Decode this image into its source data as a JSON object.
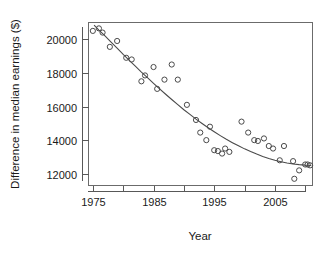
{
  "chart_data": {
    "type": "scatter",
    "title": "",
    "xlabel": "Year",
    "ylabel": "Difference in median earnings ($)",
    "xlim": [
      1974.2,
      2011.2
    ],
    "ylim": [
      11300,
      21000
    ],
    "grid": false,
    "legend": null,
    "xticks": [
      1975,
      1980,
      1985,
      1990,
      1995,
      2000,
      2005,
      2010
    ],
    "xtick_labels": [
      "1975",
      "",
      "1985",
      "",
      "1995",
      "",
      "2005",
      ""
    ],
    "yticks": [
      12000,
      14000,
      16000,
      18000,
      20000
    ],
    "ytick_labels": [
      "12000",
      "14000",
      "16000",
      "18000",
      "20000"
    ],
    "point_marker": "open-circle",
    "point_color": "#4a4a4a",
    "curve_color": "#4a4a4a",
    "x": [
      1975,
      1976,
      1976,
      1977,
      1978,
      1979,
      1980,
      1981,
      1982,
      1983,
      1984,
      1985,
      1986,
      1987,
      1988,
      1989,
      1990,
      1991,
      1992,
      1993,
      1994,
      1995,
      1996,
      1996,
      1997,
      1998,
      1999,
      2000,
      2001,
      2002,
      2003,
      2004,
      2005,
      2006,
      2007,
      2008,
      2009,
      2010,
      2011
    ],
    "y": [
      20500,
      20650,
      20400,
      19550,
      19900,
      18900,
      18800,
      17500,
      17850,
      18350,
      17050,
      17600,
      18500,
      17600,
      16100,
      15200,
      14450,
      14000,
      14800,
      13400,
      13350,
      13200,
      13500,
      13300,
      15100,
      14450,
      14000,
      13950,
      14100,
      13650,
      13500,
      12800,
      13650,
      12750,
      11700,
      12200,
      12550,
      12550,
      12500
    ],
    "series": [
      {
        "name": "Observed difference in median earnings",
        "points": [
          {
            "x": 1975,
            "y": 20500
          },
          {
            "x": 1976,
            "y": 20650
          },
          {
            "x": 1976.6,
            "y": 20400
          },
          {
            "x": 1977.8,
            "y": 19550
          },
          {
            "x": 1979,
            "y": 19900
          },
          {
            "x": 1980.5,
            "y": 18900
          },
          {
            "x": 1981.4,
            "y": 18800
          },
          {
            "x": 1983,
            "y": 17500
          },
          {
            "x": 1983.6,
            "y": 17850
          },
          {
            "x": 1985,
            "y": 18350
          },
          {
            "x": 1985.6,
            "y": 17050
          },
          {
            "x": 1986.8,
            "y": 17600
          },
          {
            "x": 1988,
            "y": 18500
          },
          {
            "x": 1989,
            "y": 17600
          },
          {
            "x": 1990.5,
            "y": 16100
          },
          {
            "x": 1992,
            "y": 15200
          },
          {
            "x": 1992.7,
            "y": 14450
          },
          {
            "x": 1993.7,
            "y": 14000
          },
          {
            "x": 1994.3,
            "y": 14800
          },
          {
            "x": 1995,
            "y": 13400
          },
          {
            "x": 1995.6,
            "y": 13350
          },
          {
            "x": 1996.3,
            "y": 13200
          },
          {
            "x": 1996.8,
            "y": 13500
          },
          {
            "x": 1997.5,
            "y": 13300
          },
          {
            "x": 1999.5,
            "y": 15100
          },
          {
            "x": 2000.6,
            "y": 14450
          },
          {
            "x": 2001.6,
            "y": 14000
          },
          {
            "x": 2002.2,
            "y": 13950
          },
          {
            "x": 2003.2,
            "y": 14100
          },
          {
            "x": 2004,
            "y": 13650
          },
          {
            "x": 2004.7,
            "y": 13500
          },
          {
            "x": 2005.8,
            "y": 12800
          },
          {
            "x": 2006.5,
            "y": 13650
          },
          {
            "x": 2008,
            "y": 12750
          },
          {
            "x": 2008.2,
            "y": 11700
          },
          {
            "x": 2009,
            "y": 12200
          },
          {
            "x": 2010,
            "y": 12550
          },
          {
            "x": 2010.4,
            "y": 12550
          },
          {
            "x": 2010.8,
            "y": 12500
          }
        ]
      }
    ],
    "fit_curve": {
      "name": "Fitted trend",
      "points": [
        {
          "x": 1975.2,
          "y": 20850
        },
        {
          "x": 1976,
          "y": 20550
        },
        {
          "x": 1977,
          "y": 20200
        },
        {
          "x": 1978,
          "y": 19830
        },
        {
          "x": 1979,
          "y": 19470
        },
        {
          "x": 1980,
          "y": 19100
        },
        {
          "x": 1981,
          "y": 18750
        },
        {
          "x": 1982,
          "y": 18400
        },
        {
          "x": 1983,
          "y": 18050
        },
        {
          "x": 1984,
          "y": 17720
        },
        {
          "x": 1985,
          "y": 17380
        },
        {
          "x": 1986,
          "y": 17050
        },
        {
          "x": 1987,
          "y": 16730
        },
        {
          "x": 1988,
          "y": 16420
        },
        {
          "x": 1989,
          "y": 16110
        },
        {
          "x": 1990,
          "y": 15810
        },
        {
          "x": 1991,
          "y": 15530
        },
        {
          "x": 1992,
          "y": 15250
        },
        {
          "x": 1993,
          "y": 14990
        },
        {
          "x": 1994,
          "y": 14740
        },
        {
          "x": 1995,
          "y": 14500
        },
        {
          "x": 1996,
          "y": 14270
        },
        {
          "x": 1997,
          "y": 14050
        },
        {
          "x": 1998,
          "y": 13850
        },
        {
          "x": 1999,
          "y": 13660
        },
        {
          "x": 2000,
          "y": 13480
        },
        {
          "x": 2001,
          "y": 13320
        },
        {
          "x": 2002,
          "y": 13170
        },
        {
          "x": 2003,
          "y": 13030
        },
        {
          "x": 2004,
          "y": 12910
        },
        {
          "x": 2005,
          "y": 12800
        },
        {
          "x": 2006,
          "y": 12710
        },
        {
          "x": 2007,
          "y": 12640
        },
        {
          "x": 2008,
          "y": 12580
        },
        {
          "x": 2009,
          "y": 12540
        },
        {
          "x": 2010,
          "y": 12510
        },
        {
          "x": 2011,
          "y": 12490
        }
      ]
    }
  }
}
